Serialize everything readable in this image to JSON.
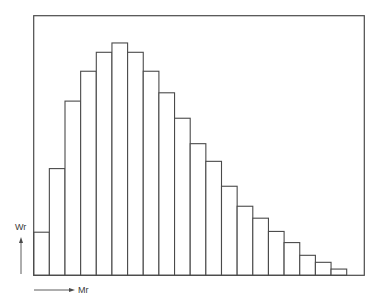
{
  "chart_data": {
    "type": "bar",
    "subtype": "histogram",
    "title": "",
    "xlabel": "Mr",
    "ylabel": "Wr",
    "x_axis_arrow": "right",
    "y_axis_arrow": "up",
    "tick_labels": false,
    "grid": false,
    "legend": null,
    "ylim": [
      0,
      100
    ],
    "bin_count": 20,
    "categories": [
      "1",
      "2",
      "3",
      "4",
      "5",
      "6",
      "7",
      "8",
      "9",
      "10",
      "11",
      "12",
      "13",
      "14",
      "15",
      "16",
      "17",
      "18",
      "19",
      "20"
    ],
    "values": [
      16.6,
      41.1,
      67.1,
      78.6,
      85.9,
      89.5,
      85.9,
      78.6,
      70.3,
      60.5,
      50.7,
      43.9,
      34.3,
      26.6,
      22.0,
      16.9,
      12.6,
      7.7,
      5.0,
      2.4
    ],
    "value_units": "relative (percent of frame height; no numeric scale shown)"
  },
  "colors": {
    "stroke": "#4a4a4a",
    "fill": "#ffffff",
    "text": "#3a3a3a"
  },
  "layout": {
    "frame": {
      "left": 33.7,
      "top": 15.7,
      "right": 364.3,
      "bottom": 275.3
    },
    "bar_width": 15.65
  }
}
